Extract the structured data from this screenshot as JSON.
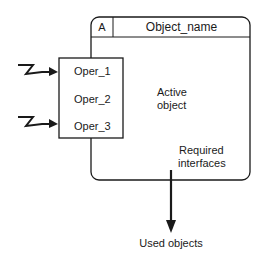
{
  "diagram": {
    "active_object": {
      "type_letter": "A",
      "name": "Object_name",
      "body_label_line1": "Active",
      "body_label_line2": "object"
    },
    "operations": [
      {
        "label": "Oper_1",
        "has_incoming_event": true
      },
      {
        "label": "Oper_2",
        "has_incoming_event": false
      },
      {
        "label": "Oper_3",
        "has_incoming_event": true
      }
    ],
    "required_interfaces": {
      "line1": "Required",
      "line2": "interfaces"
    },
    "used_objects": "Used objects",
    "colors": {
      "stroke": "#1a1a1a",
      "background": "#ffffff"
    }
  }
}
